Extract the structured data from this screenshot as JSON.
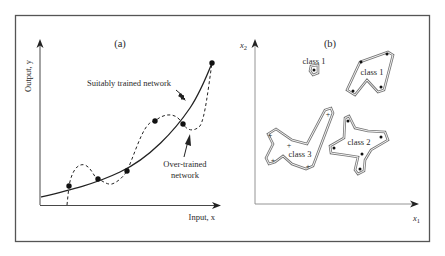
{
  "figure": {
    "frame_color": "#555555",
    "panel_a": {
      "label": "(a)",
      "y_axis_label": "Output, y",
      "x_axis_label": "Input, x",
      "annotation_suitable": "Suitably trained network",
      "annotation_overtrained_line1": "Over-trained",
      "annotation_overtrained_line2": "network",
      "data_points": [
        {
          "x": 69,
          "y": 186
        },
        {
          "x": 98,
          "y": 179
        },
        {
          "x": 127,
          "y": 171
        },
        {
          "x": 155,
          "y": 121
        },
        {
          "x": 183,
          "y": 124
        },
        {
          "x": 212,
          "y": 63
        }
      ]
    },
    "panel_b": {
      "label": "(b)",
      "y_axis_label": "x",
      "y_axis_subscript": "2",
      "x_axis_label": "x",
      "x_axis_subscript": "1",
      "regions": [
        {
          "name": "class 1",
          "id": "class1-small"
        },
        {
          "name": "class 1",
          "id": "class1-large"
        },
        {
          "name": "class 2",
          "id": "class2"
        },
        {
          "name": "class 3",
          "id": "class3"
        }
      ]
    }
  }
}
